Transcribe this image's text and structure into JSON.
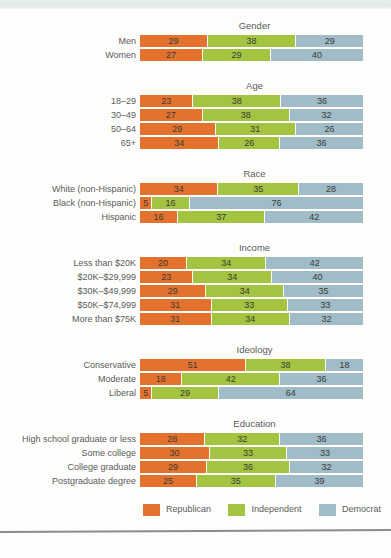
{
  "colors": {
    "republican": "#E2722E",
    "independent": "#A2C440",
    "democrat": "#A0BCC8",
    "top_band": "#E1EBE6",
    "rule": "#8C8C8C",
    "value_text": "#3E3A35",
    "label_text": "#5C5C5A"
  },
  "legend": {
    "items": [
      {
        "key": "republican",
        "label": "Republican"
      },
      {
        "key": "independent",
        "label": "Independent"
      },
      {
        "key": "democrat",
        "label": "Democrat"
      }
    ]
  },
  "chart_data": {
    "type": "bar",
    "subtype": "horizontal-stacked-percentage",
    "value_unit": "percent",
    "legend_position": "bottom",
    "series_names": [
      "Republican",
      "Independent",
      "Democrat"
    ],
    "series_keys": [
      "republican",
      "independent",
      "democrat"
    ],
    "sections": [
      {
        "title": "Gender",
        "rows": [
          {
            "label": "Men",
            "values": [
              29,
              38,
              29
            ]
          },
          {
            "label": "Women",
            "values": [
              27,
              29,
              40
            ]
          }
        ]
      },
      {
        "title": "Age",
        "rows": [
          {
            "label": "18–29",
            "values": [
              23,
              38,
              36
            ]
          },
          {
            "label": "30–49",
            "values": [
              27,
              38,
              32
            ]
          },
          {
            "label": "50–64",
            "values": [
              29,
              31,
              26
            ]
          },
          {
            "label": "65+",
            "values": [
              34,
              26,
              36
            ]
          }
        ]
      },
      {
        "title": "Race",
        "rows": [
          {
            "label": "White (non-Hispanic)",
            "values": [
              34,
              35,
              28
            ]
          },
          {
            "label": "Black (non-Hispanic)",
            "values": [
              5,
              16,
              76
            ]
          },
          {
            "label": "Hispanic",
            "values": [
              16,
              37,
              42
            ]
          }
        ]
      },
      {
        "title": "Income",
        "rows": [
          {
            "label": "Less than $20K",
            "values": [
              20,
              34,
              42
            ]
          },
          {
            "label": "$20K–$29,999",
            "values": [
              23,
              34,
              40
            ]
          },
          {
            "label": "$30K–$49,999",
            "values": [
              29,
              34,
              35
            ]
          },
          {
            "label": "$50K–$74,999",
            "values": [
              31,
              33,
              33
            ]
          },
          {
            "label": "More than $75K",
            "values": [
              31,
              34,
              32
            ]
          }
        ]
      },
      {
        "title": "Ideology",
        "rows": [
          {
            "label": "Conservative",
            "values": [
              51,
              38,
              18
            ]
          },
          {
            "label": "Moderate",
            "values": [
              18,
              42,
              36
            ]
          },
          {
            "label": "Liberal",
            "values": [
              5,
              29,
              64
            ]
          }
        ]
      },
      {
        "title": "Education",
        "rows": [
          {
            "label": "High school graduate or less",
            "values": [
              28,
              32,
              36
            ]
          },
          {
            "label": "Some college",
            "values": [
              30,
              33,
              33
            ]
          },
          {
            "label": "College graduate",
            "values": [
              29,
              36,
              32
            ]
          },
          {
            "label": "Postgraduate degree",
            "values": [
              25,
              35,
              39
            ]
          }
        ]
      }
    ]
  }
}
